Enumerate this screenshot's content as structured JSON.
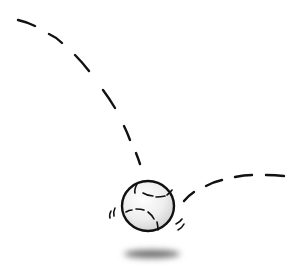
{
  "illustration": {
    "subject": "bouncing baseball",
    "elements": {
      "trajectory_in": "dashed arc descending from upper-left",
      "ball": "baseball with stitches",
      "motion_lines": "impact wiggle marks",
      "trajectory_out": "dashed arc rising to the right",
      "shadow": "blurred ground shadow"
    },
    "colors": {
      "ink": "#111111",
      "ball_fill": "#f4f4f4",
      "ball_shade": "#d9d9d9",
      "shadow": "#6a6a6a",
      "background": "#ffffff"
    }
  }
}
